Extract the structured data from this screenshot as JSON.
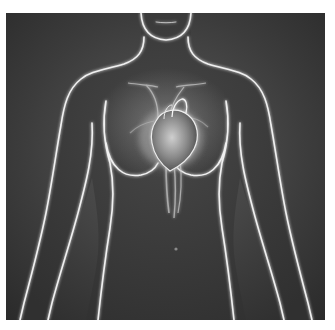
{
  "image": {
    "subject": "Female torso anatomical illustration with glowing heart",
    "style": "grayscale x-ray glow",
    "alt": "Semi-transparent female upper body with highlighted heart and major vessels"
  },
  "colors": {
    "page_background": "#ffffff",
    "frame_dark": "#2e2e2e",
    "frame_mid": "#4a4a4a",
    "body_fill": "#3a3a3a",
    "outline_glow": "#f2f2f2",
    "heart_glow": "#d8d8d8"
  },
  "regions": [
    "head-chin",
    "neck",
    "shoulders",
    "arms",
    "chest",
    "heart",
    "aorta-vessels",
    "abdomen",
    "navel",
    "hips"
  ]
}
